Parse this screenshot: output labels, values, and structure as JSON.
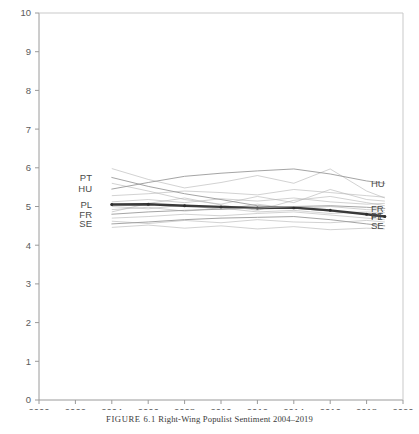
{
  "figure": {
    "caption_prefix": "FIGURE 6.1",
    "caption_text": "Right-Wing Populist Sentiment 2004–2019"
  },
  "chart_data": {
    "type": "line",
    "title": "Right-Wing Populist Sentiment 2004–2019",
    "xlabel": "",
    "ylabel": "",
    "xlim": [
      2000,
      2020
    ],
    "ylim": [
      0,
      10
    ],
    "grid": false,
    "legend_position": "inline-endpoints",
    "xticks": [
      "2000",
      "2002",
      "2004",
      "2006",
      "2008",
      "2010",
      "2012",
      "2014",
      "2016",
      "2018",
      "2020"
    ],
    "yticks": [
      "0",
      "1",
      "2",
      "3",
      "4",
      "5",
      "6",
      "7",
      "8",
      "9",
      "10"
    ],
    "x": [
      2004,
      2006,
      2008,
      2010,
      2012,
      2014,
      2016,
      2018,
      2019
    ],
    "series": [
      {
        "name": "PT",
        "label_left": "PT",
        "label_right": "PT",
        "highlight": false,
        "color": "#9a9a9a",
        "values": [
          5.75,
          5.52,
          5.33,
          5.18,
          5.02,
          4.96,
          4.88,
          4.8,
          4.76
        ]
      },
      {
        "name": "HU",
        "label_left": "HU",
        "label_right": "HU",
        "highlight": false,
        "color": "#9a9a9a",
        "values": [
          5.45,
          5.62,
          5.78,
          5.86,
          5.92,
          5.97,
          5.84,
          5.66,
          5.6
        ]
      },
      {
        "name": "PL",
        "label_left": "PL",
        "label_right": "PL",
        "highlight": true,
        "color": "#3a3a3a",
        "values": [
          5.05,
          5.06,
          5.02,
          4.99,
          4.96,
          4.97,
          4.9,
          4.8,
          4.74
        ]
      },
      {
        "name": "FR",
        "label_left": "FR",
        "label_right": "FR",
        "highlight": false,
        "color": "#9a9a9a",
        "values": [
          4.8,
          4.86,
          4.9,
          4.93,
          4.96,
          5.0,
          5.02,
          4.98,
          4.95
        ]
      },
      {
        "name": "SE",
        "label_left": "SE",
        "label_right": "SE",
        "highlight": false,
        "color": "#9a9a9a",
        "values": [
          4.55,
          4.6,
          4.66,
          4.7,
          4.72,
          4.74,
          4.66,
          4.55,
          4.5
        ]
      }
    ],
    "background_series": [
      {
        "name": "bg-1",
        "values": [
          5.98,
          5.7,
          5.48,
          5.62,
          5.8,
          5.6,
          5.97,
          5.4,
          5.22
        ]
      },
      {
        "name": "bg-2",
        "values": [
          5.28,
          5.33,
          5.4,
          5.36,
          5.3,
          5.44,
          5.36,
          5.28,
          5.24
        ]
      },
      {
        "name": "bg-3",
        "values": [
          5.12,
          5.18,
          5.1,
          5.2,
          5.14,
          5.22,
          5.12,
          5.06,
          5.08
        ]
      },
      {
        "name": "bg-4",
        "values": [
          5.0,
          4.94,
          5.04,
          4.92,
          5.06,
          4.94,
          5.0,
          4.92,
          4.9
        ]
      },
      {
        "name": "bg-5",
        "values": [
          4.92,
          4.98,
          4.88,
          4.96,
          4.86,
          4.9,
          4.82,
          4.86,
          4.84
        ]
      },
      {
        "name": "bg-6",
        "values": [
          4.7,
          4.74,
          4.8,
          4.76,
          4.82,
          4.86,
          4.78,
          4.7,
          4.66
        ]
      },
      {
        "name": "bg-7",
        "values": [
          4.62,
          4.56,
          4.64,
          4.58,
          4.66,
          4.6,
          4.58,
          4.64,
          4.6
        ]
      },
      {
        "name": "bg-8",
        "values": [
          4.46,
          4.52,
          4.44,
          4.5,
          4.42,
          4.48,
          4.4,
          4.44,
          4.42
        ]
      },
      {
        "name": "bg-9",
        "values": [
          5.6,
          5.4,
          5.18,
          5.06,
          5.26,
          5.1,
          5.44,
          5.18,
          5.14
        ]
      },
      {
        "name": "bg-10",
        "values": [
          4.86,
          5.08,
          5.22,
          5.04,
          4.9,
          5.16,
          5.26,
          5.1,
          5.02
        ]
      }
    ]
  }
}
